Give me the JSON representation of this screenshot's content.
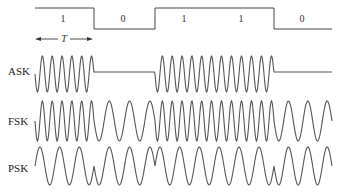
{
  "figure": {
    "bits": [
      "1",
      "0",
      "1",
      "1",
      "0"
    ],
    "period_label": "T",
    "labels": {
      "ask": "ASK",
      "fsk": "FSK",
      "psk": "PSK"
    },
    "colors": {
      "stroke": "#555555",
      "background": "#ffffff"
    }
  }
}
